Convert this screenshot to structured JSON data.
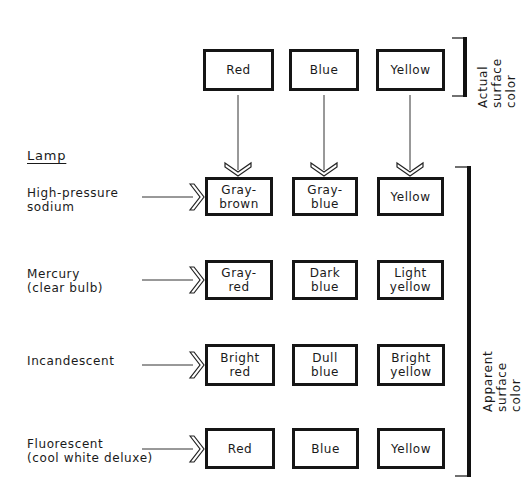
{
  "diagram": {
    "lamp_heading": "Lamp",
    "actual_colors": [
      "Red",
      "Blue",
      "Yellow"
    ],
    "actual_label": "Actual surface\ncolor",
    "apparent_label": "Apparent  surface color",
    "rows": [
      {
        "lamp": "High-pressure\nsodium",
        "apparent": [
          "Gray-\nbrown",
          "Gray-\nblue",
          "Yellow"
        ]
      },
      {
        "lamp": "Mercury\n(clear bulb)",
        "apparent": [
          "Gray-\nred",
          "Dark\nblue",
          "Light\nyellow"
        ]
      },
      {
        "lamp": "Incandescent",
        "apparent": [
          "Bright\nred",
          "Dull\nblue",
          "Bright\nyellow"
        ]
      },
      {
        "lamp": "Fluorescent\n(cool white deluxe)",
        "apparent": [
          "Red",
          "Blue",
          "Yellow"
        ]
      }
    ]
  }
}
